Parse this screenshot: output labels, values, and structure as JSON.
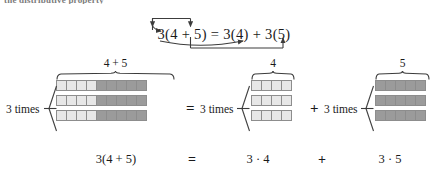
{
  "page": {
    "clipped_top_text": "the distributive property",
    "background_color": "#ffffff",
    "light_cell_color": "#e7e7e7",
    "dark_cell_color": "#9b9b9b",
    "cell_border_color": "#8d8d8d",
    "ink_color": "#1a1a1a"
  },
  "equation": {
    "left": "3(4 + 5)",
    "equals": "=",
    "term1": "3(4)",
    "plus": "+",
    "term2": "3(5)",
    "full": "3(4 + 5) = 3(4) + 3(5)",
    "arrows": [
      {
        "name": "arrow-3-to-4",
        "from": "3",
        "to": "4",
        "path": "top"
      },
      {
        "name": "arrow-3-to-5",
        "from": "3",
        "to": "5",
        "path": "bottom"
      }
    ]
  },
  "diagram": {
    "groups": [
      {
        "id": "group-sum",
        "title": "4 + 5",
        "times_label": "3 times",
        "rows": 3,
        "cells_per_row": 9,
        "light_cells": 4,
        "dark_cells": 5
      },
      {
        "id": "group-four",
        "title": "4",
        "times_label": "3 times",
        "rows": 3,
        "cells_per_row": 4,
        "light_cells": 4,
        "dark_cells": 0
      },
      {
        "id": "group-five",
        "title": "5",
        "times_label": "3 times",
        "rows": 3,
        "cells_per_row": 5,
        "light_cells": 0,
        "dark_cells": 5
      }
    ],
    "operators": {
      "equals": "=",
      "plus": "+"
    }
  },
  "captions": {
    "left": "3(4 + 5)",
    "equals": "=",
    "middle": "3 · 4",
    "plus": "+",
    "right": "3 · 5"
  }
}
